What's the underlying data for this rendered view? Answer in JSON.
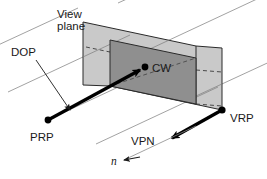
{
  "figure": {
    "background_color": "#ffffff",
    "labels": {
      "view_plane_line1": "View",
      "view_plane_line2": "plane",
      "dop": "DOP",
      "cw": "CW",
      "prp": "PRP",
      "vrp": "VRP",
      "vpn": "VPN",
      "n": "n"
    },
    "colors": {
      "outer_plane_fill": "#c9c9c9",
      "inner_window_fill": "#8f8f8f",
      "grid_line": "#8a8a8a",
      "outline": "#2a2a2a",
      "vector": "#000000",
      "text": "#1a1a1a"
    },
    "points": {
      "prp": {
        "x": 48,
        "y": 120
      },
      "cw": {
        "x": 145,
        "y": 67
      },
      "vrp": {
        "x": 222,
        "y": 110
      }
    },
    "geometry": {
      "outer_plane_polygon": "83,22 196,46 222,48 222,110 110,86 83,85",
      "inner_window_polygon": "110,40 196,58 196,104 110,86",
      "grid_line_count": 7
    }
  }
}
